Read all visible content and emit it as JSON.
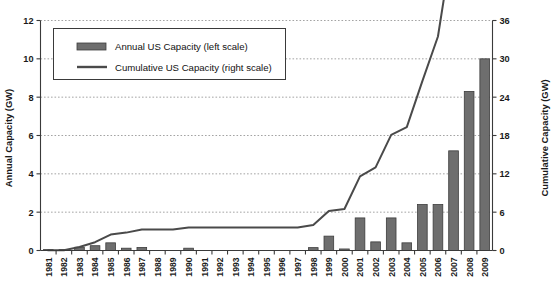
{
  "chart_data": {
    "type": "bar",
    "title": "",
    "subtitle": "",
    "xlabel": "",
    "ylabel": "Annual Capacity (GW)",
    "y2label": "Cumulative Capacity (GW)",
    "grid": true,
    "legend_position": "top-left",
    "ylim": [
      0,
      12
    ],
    "y2lim": [
      0,
      36
    ],
    "yticks": [
      "0",
      "2",
      "4",
      "6",
      "8",
      "10",
      "12"
    ],
    "ytick_values": [
      0,
      2,
      4,
      6,
      8,
      10,
      12
    ],
    "y2ticks": [
      "0",
      "6",
      "12",
      "18",
      "24",
      "30",
      "36"
    ],
    "y2tick_values": [
      0,
      6,
      12,
      18,
      24,
      30,
      36
    ],
    "categories": [
      "1981",
      "1982",
      "1983",
      "1984",
      "1985",
      "1986",
      "1987",
      "1988",
      "1989",
      "1990",
      "1991",
      "1992",
      "1993",
      "1994",
      "1995",
      "1996",
      "1997",
      "1998",
      "1999",
      "2000",
      "2001",
      "2002",
      "2003",
      "2004",
      "2005",
      "2006",
      "2007",
      "2008",
      "2009"
    ],
    "series": [
      {
        "name": "Annual US Capacity (left scale)",
        "axis": "left",
        "type": "bar",
        "units": "GW",
        "color": "#6e6e6e",
        "values": [
          0.01,
          0.01,
          0.17,
          0.25,
          0.4,
          0.12,
          0.16,
          0.0,
          0.0,
          0.12,
          0.0,
          0.0,
          0.0,
          0.0,
          0.0,
          0.0,
          0.0,
          0.15,
          0.75,
          0.08,
          1.7,
          0.45,
          1.7,
          0.4,
          2.4,
          2.4,
          5.2,
          8.3,
          10.0
        ]
      },
      {
        "name": "Cumulative US Capacity (right scale)",
        "axis": "right",
        "type": "line",
        "units": "GW",
        "color": "#4a4a4a",
        "values": [
          0.02,
          0.05,
          0.55,
          1.3,
          2.5,
          2.8,
          3.3,
          3.3,
          3.3,
          3.6,
          3.6,
          3.6,
          3.6,
          3.6,
          3.6,
          3.6,
          3.6,
          4.0,
          6.2,
          6.5,
          11.6,
          13.0,
          18.1,
          19.3,
          26.5,
          33.5,
          49.0,
          73.8,
          104.0
        ]
      }
    ],
    "annotations": []
  },
  "legend": {
    "items": [
      {
        "label": "Annual US Capacity (left scale)",
        "marker": "bar-swatch"
      },
      {
        "label": "Cumulative US Capacity (right scale)",
        "marker": "line-swatch"
      }
    ]
  },
  "colors": {
    "bar_fill": "#6e6e6e",
    "bar_stroke": "#3d3d3d",
    "line": "#4a4a4a",
    "axis": "#3a3a3a",
    "grid": "#9a9a9a",
    "background": "#ffffff"
  }
}
